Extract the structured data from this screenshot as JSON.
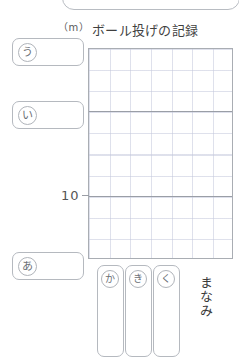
{
  "worksheet": {
    "title": "ボール投げの記録",
    "unit_label": "（m）",
    "student_name": "まなみ"
  },
  "top_banner": {
    "name": "instruction-banner",
    "text": ""
  },
  "answer_slots": [
    {
      "id": "slot-u",
      "marker": "う",
      "value": ""
    },
    {
      "id": "slot-i",
      "marker": "い",
      "value": ""
    },
    {
      "id": "slot-a",
      "marker": "あ",
      "value": ""
    }
  ],
  "choice_tiles": [
    {
      "id": "tile-ka",
      "marker": "か",
      "value": ""
    },
    {
      "id": "tile-ki",
      "marker": "き",
      "value": ""
    },
    {
      "id": "tile-ku",
      "marker": "く",
      "value": ""
    }
  ],
  "chart_data": {
    "type": "bar",
    "title": "ボール投げの記録",
    "xlabel": "",
    "ylabel": "（m）",
    "categories": [
      "まなみ"
    ],
    "values": [
      16
    ],
    "ylim": [
      0,
      20
    ],
    "yticks": [
      10
    ],
    "ytick_labels": [
      "10"
    ],
    "grid": true,
    "legend": false
  }
}
